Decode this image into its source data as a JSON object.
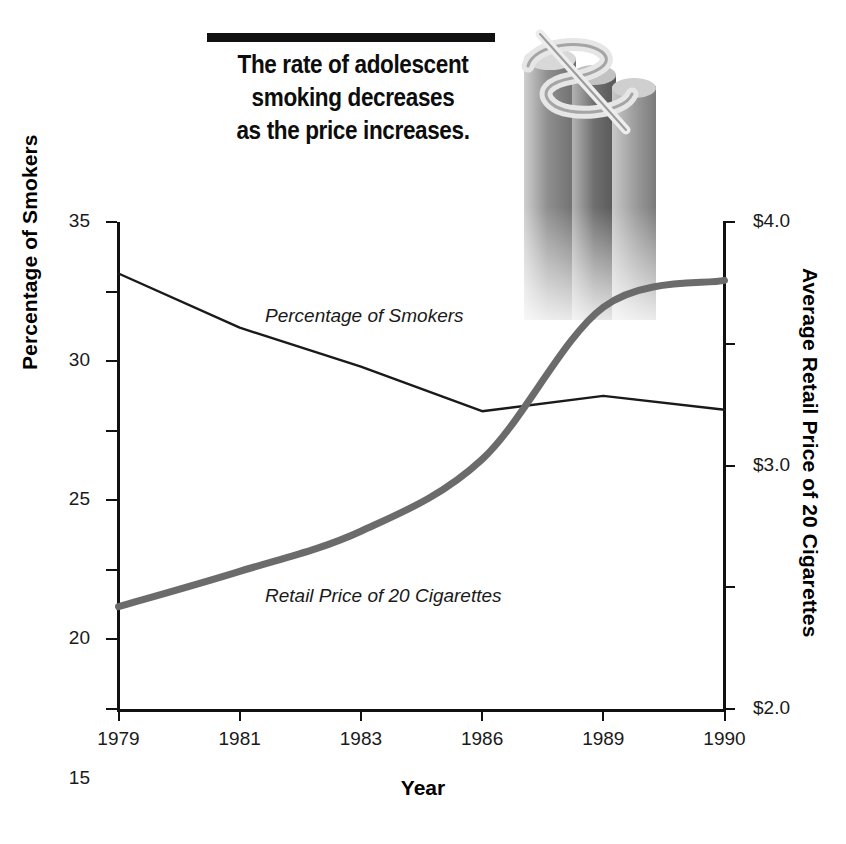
{
  "title": {
    "line1": "The rate of adolescent",
    "line2": "smoking decreases",
    "line3": "as the price increases."
  },
  "decoration": {
    "dollar_sign_graphic": "dollar-sign-3d-columns"
  },
  "chart_data": {
    "type": "line",
    "title": "The rate of adolescent smoking decreases as the price increases.",
    "xlabel": "Year",
    "ylabel": "Percentage of Smokers",
    "y2label": "Average Retail Price of 20 Cigarettes",
    "categories": [
      "1979",
      "1981",
      "1983",
      "1986",
      "1989",
      "1990"
    ],
    "grid": false,
    "legend": "inline-labels",
    "ylim": [
      0,
      35
    ],
    "yticks": [
      "0",
      "5",
      "10",
      "15",
      "20",
      "25",
      "30",
      "35"
    ],
    "ytick_values": [
      0,
      5,
      10,
      15,
      20,
      25,
      30,
      35
    ],
    "y2lim": [
      0,
      4.0
    ],
    "y2ticks": [
      "$3.0",
      "$1.0",
      "$2.0",
      "$3.0",
      "$4.0"
    ],
    "y2tick_values": [
      0,
      1.0,
      2.0,
      3.0,
      4.0
    ],
    "series": [
      {
        "name": "Percentage of Smokers",
        "axis": "left",
        "color": "#1a1a1a",
        "width": 2.4,
        "values": [
          31.3,
          27.4,
          24.6,
          21.4,
          22.5,
          21.5
        ]
      },
      {
        "name": "Retail Price of 20 Cigarettes",
        "axis": "right",
        "color": "#6b6b6b",
        "width": 7,
        "values": [
          0.84,
          1.13,
          1.46,
          2.05,
          3.3,
          3.52
        ]
      }
    ],
    "annotations": [
      {
        "text": "Percentage of Smokers",
        "style": "italic"
      },
      {
        "text": "Retail Price of 20 Cigarettes",
        "style": "italic"
      }
    ]
  }
}
